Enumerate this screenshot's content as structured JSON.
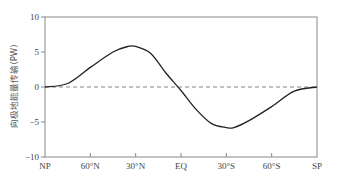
{
  "chart_data": {
    "type": "line",
    "title": "",
    "xlabel": "",
    "ylabel": "向极地能量传输(PW)",
    "x_ticks": [
      "NP",
      "60°N",
      "30°N",
      "EQ",
      "30°S",
      "60°S",
      "SP"
    ],
    "y_ticks": [
      10,
      5,
      0,
      -5,
      -10
    ],
    "ylim": [
      -10,
      10
    ],
    "grid": false,
    "reference_line": {
      "y": 0,
      "style": "dashed"
    },
    "series": [
      {
        "name": "poleward energy transport",
        "x": [
          "NP",
          "75°N",
          "60°N",
          "45°N",
          "35°N",
          "30°N",
          "20°N",
          "10°N",
          "EQ",
          "10°S",
          "20°S",
          "30°S",
          "35°S",
          "45°S",
          "60°S",
          "75°S",
          "SP"
        ],
        "values": [
          0,
          0.5,
          2.8,
          5.0,
          5.8,
          5.8,
          4.8,
          2.0,
          -0.5,
          -3.2,
          -5.2,
          -5.8,
          -5.8,
          -4.8,
          -2.8,
          -0.6,
          0
        ]
      }
    ]
  }
}
